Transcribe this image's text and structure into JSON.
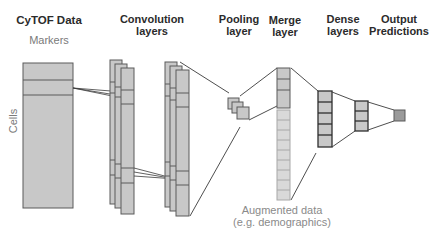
{
  "labels": {
    "cytof": "CyTOF Data",
    "markers": "Markers",
    "cells": "Cells",
    "convolution_l1": "Convolution",
    "convolution_l2": "layers",
    "pooling_l1": "Pooling",
    "pooling_l2": "layer",
    "merge_l1": "Merge",
    "merge_l2": "layer",
    "dense_l1": "Dense",
    "dense_l2": "layers",
    "output_l1": "Output",
    "output_l2": "Predictions",
    "augmented_l1": "Augmented data",
    "augmented_l2": "(e.g. demographics)"
  },
  "colors": {
    "block_fill": "#c8c8c8",
    "block_stroke": "#5a5a5a",
    "light_fill": "#d9d9d9",
    "light_stroke": "#a8a8a8",
    "dense_stroke": "#2e2e2e",
    "output_fill": "#9a9a9a",
    "line": "#3a3a3a"
  }
}
